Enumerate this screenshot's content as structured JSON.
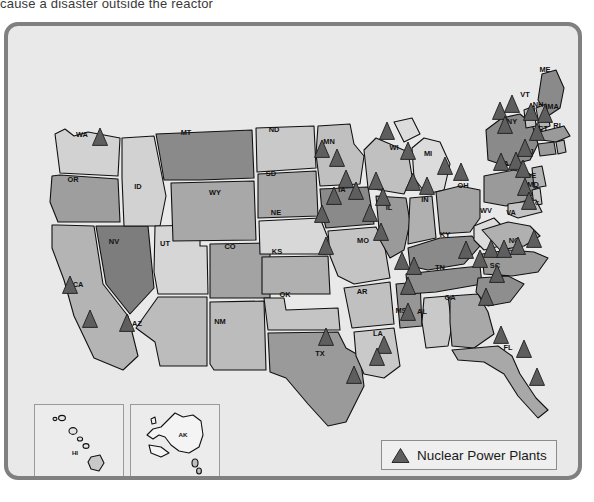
{
  "caption": {
    "text": "cause a disaster outside the reactor"
  },
  "map": {
    "title": "United States Nuclear Power Plants Map",
    "background_color": "#e9e9e9",
    "border_color": "#808080",
    "marker_color": "#5e5e5e",
    "outline_color": "#111111"
  },
  "legend": {
    "marker_icon": "triangle-icon",
    "label": "Nuclear Power Plants"
  },
  "insets": [
    {
      "name": "hawaii-inset",
      "label": "HI"
    },
    {
      "name": "alaska-inset",
      "label": "AK"
    }
  ],
  "states": [
    {
      "code": "WA",
      "name": "Washington",
      "x": 78,
      "y": 131,
      "plants": 1
    },
    {
      "code": "OR",
      "name": "Oregon",
      "x": 69,
      "y": 176,
      "plants": 0
    },
    {
      "code": "CA",
      "name": "California",
      "x": 74,
      "y": 281,
      "plants": 2
    },
    {
      "code": "NV",
      "name": "Nevada",
      "x": 110,
      "y": 238,
      "plants": 0
    },
    {
      "code": "ID",
      "name": "Idaho",
      "x": 134,
      "y": 183,
      "plants": 0
    },
    {
      "code": "UT",
      "name": "Utah",
      "x": 161,
      "y": 240,
      "plants": 0
    },
    {
      "code": "AZ",
      "name": "Arizona",
      "x": 133,
      "y": 320,
      "plants": 1
    },
    {
      "code": "MT",
      "name": "Montana",
      "x": 182,
      "y": 129,
      "plants": 0
    },
    {
      "code": "WY",
      "name": "Wyoming",
      "x": 211,
      "y": 189,
      "plants": 0
    },
    {
      "code": "CO",
      "name": "Colorado",
      "x": 226,
      "y": 243,
      "plants": 0
    },
    {
      "code": "NM",
      "name": "New Mexico",
      "x": 216,
      "y": 318,
      "plants": 0
    },
    {
      "code": "ND",
      "name": "North Dakota",
      "x": 270,
      "y": 126,
      "plants": 0
    },
    {
      "code": "SD",
      "name": "South Dakota",
      "x": 267,
      "y": 170,
      "plants": 0
    },
    {
      "code": "NE",
      "name": "Nebraska",
      "x": 272,
      "y": 209,
      "plants": 0
    },
    {
      "code": "KS",
      "name": "Kansas",
      "x": 273,
      "y": 248,
      "plants": 1
    },
    {
      "code": "OK",
      "name": "Oklahoma",
      "x": 281,
      "y": 291,
      "plants": 0
    },
    {
      "code": "TX",
      "name": "Texas",
      "x": 316,
      "y": 350,
      "plants": 2
    },
    {
      "code": "MN",
      "name": "Minnesota",
      "x": 325,
      "y": 138,
      "plants": 2
    },
    {
      "code": "IA",
      "name": "Iowa",
      "x": 338,
      "y": 186,
      "plants": 3
    },
    {
      "code": "MO",
      "name": "Missouri",
      "x": 359,
      "y": 237,
      "plants": 1
    },
    {
      "code": "AR",
      "name": "Arkansas",
      "x": 358,
      "y": 288,
      "plants": 0
    },
    {
      "code": "LA",
      "name": "Louisiana",
      "x": 374,
      "y": 330,
      "plants": 2
    },
    {
      "code": "WI",
      "name": "Wisconsin",
      "x": 390,
      "y": 144,
      "plants": 1
    },
    {
      "code": "IL",
      "name": "Illinois",
      "x": 385,
      "y": 204,
      "plants": 3
    },
    {
      "code": "MS",
      "name": "Mississippi",
      "x": 397,
      "y": 307,
      "plants": 1
    },
    {
      "code": "MI",
      "name": "Michigan",
      "x": 424,
      "y": 150,
      "plants": 2
    },
    {
      "code": "IN",
      "name": "Indiana",
      "x": 421,
      "y": 196,
      "plants": 0
    },
    {
      "code": "KY",
      "name": "Kentucky",
      "x": 441,
      "y": 231,
      "plants": 0
    },
    {
      "code": "TN",
      "name": "Tennessee",
      "x": 436,
      "y": 264,
      "plants": 2
    },
    {
      "code": "AL",
      "name": "Alabama",
      "x": 418,
      "y": 308,
      "plants": 2
    },
    {
      "code": "GA",
      "name": "Georgia",
      "x": 446,
      "y": 294,
      "plants": 3
    },
    {
      "code": "FL",
      "name": "Florida",
      "x": 504,
      "y": 344,
      "plants": 3
    },
    {
      "code": "OH",
      "name": "Ohio",
      "x": 459,
      "y": 182,
      "plants": 2
    },
    {
      "code": "WV",
      "name": "West Virginia",
      "x": 482,
      "y": 207,
      "plants": 0
    },
    {
      "code": "VA",
      "name": "Virginia",
      "x": 507,
      "y": 209,
      "plants": 1
    },
    {
      "code": "NC",
      "name": "North Carolina",
      "x": 510,
      "y": 237,
      "plants": 4
    },
    {
      "code": "SC",
      "name": "South Carolina",
      "x": 491,
      "y": 262,
      "plants": 4
    },
    {
      "code": "PA",
      "name": "Pennsylvania",
      "x": 500,
      "y": 160,
      "plants": 3
    },
    {
      "code": "NY",
      "name": "New York",
      "x": 508,
      "y": 118,
      "plants": 3
    },
    {
      "code": "ME",
      "name": "Maine",
      "x": 541,
      "y": 66,
      "plants": 0
    },
    {
      "code": "VT",
      "name": "Vermont",
      "x": 521,
      "y": 91,
      "plants": 1
    },
    {
      "code": "NH",
      "name": "New Hampshire",
      "x": 534,
      "y": 101,
      "plants": 1
    },
    {
      "code": "MA",
      "name": "Massachusetts",
      "x": 549,
      "y": 103,
      "plants": 1
    },
    {
      "code": "CT",
      "name": "Connecticut",
      "x": 539,
      "y": 125,
      "plants": 1
    },
    {
      "code": "RI",
      "name": "Rhode Island",
      "x": 553,
      "y": 122,
      "plants": 0
    },
    {
      "code": "NJ",
      "name": "New Jersey",
      "x": 525,
      "y": 148,
      "plants": 1
    },
    {
      "code": "DE",
      "name": "Delaware",
      "x": 527,
      "y": 172,
      "plants": 0
    },
    {
      "code": "MD",
      "name": "Maryland",
      "x": 529,
      "y": 181,
      "plants": 1
    },
    {
      "code": "D.C.",
      "name": "District of Columbia",
      "x": 531,
      "y": 199,
      "plants": 1
    }
  ],
  "plant_markers": [
    {
      "x": 96,
      "y": 136
    },
    {
      "x": 66,
      "y": 284
    },
    {
      "x": 86,
      "y": 318
    },
    {
      "x": 123,
      "y": 322
    },
    {
      "x": 322,
      "y": 245
    },
    {
      "x": 318,
      "y": 148
    },
    {
      "x": 333,
      "y": 157
    },
    {
      "x": 318,
      "y": 213
    },
    {
      "x": 342,
      "y": 178
    },
    {
      "x": 352,
      "y": 190
    },
    {
      "x": 330,
      "y": 195
    },
    {
      "x": 377,
      "y": 231
    },
    {
      "x": 383,
      "y": 130
    },
    {
      "x": 372,
      "y": 180
    },
    {
      "x": 379,
      "y": 196
    },
    {
      "x": 366,
      "y": 212
    },
    {
      "x": 380,
      "y": 344
    },
    {
      "x": 373,
      "y": 356
    },
    {
      "x": 409,
      "y": 181
    },
    {
      "x": 404,
      "y": 150
    },
    {
      "x": 441,
      "y": 165
    },
    {
      "x": 457,
      "y": 171
    },
    {
      "x": 423,
      "y": 185
    },
    {
      "x": 404,
      "y": 285
    },
    {
      "x": 410,
      "y": 265
    },
    {
      "x": 404,
      "y": 311
    },
    {
      "x": 398,
      "y": 260
    },
    {
      "x": 462,
      "y": 249
    },
    {
      "x": 476,
      "y": 258
    },
    {
      "x": 487,
      "y": 248
    },
    {
      "x": 500,
      "y": 248
    },
    {
      "x": 514,
      "y": 245
    },
    {
      "x": 530,
      "y": 238
    },
    {
      "x": 493,
      "y": 273
    },
    {
      "x": 482,
      "y": 296
    },
    {
      "x": 497,
      "y": 334
    },
    {
      "x": 520,
      "y": 348
    },
    {
      "x": 533,
      "y": 376
    },
    {
      "x": 350,
      "y": 374
    },
    {
      "x": 322,
      "y": 336
    },
    {
      "x": 497,
      "y": 161
    },
    {
      "x": 512,
      "y": 160
    },
    {
      "x": 519,
      "y": 168
    },
    {
      "x": 521,
      "y": 186
    },
    {
      "x": 525,
      "y": 200
    },
    {
      "x": 508,
      "y": 103
    },
    {
      "x": 496,
      "y": 110
    },
    {
      "x": 501,
      "y": 124
    },
    {
      "x": 527,
      "y": 111
    },
    {
      "x": 541,
      "y": 113
    },
    {
      "x": 533,
      "y": 131
    },
    {
      "x": 521,
      "y": 147
    }
  ]
}
